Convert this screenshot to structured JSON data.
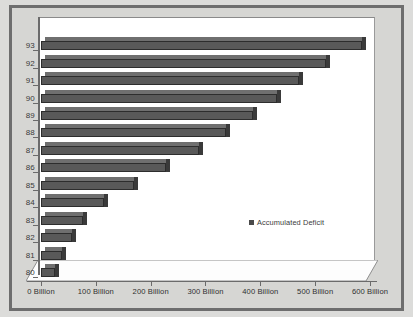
{
  "chart_data": {
    "type": "bar",
    "orientation": "horizontal",
    "title": "",
    "subtitle": "",
    "xlabel": "",
    "ylabel": "",
    "categories": [
      "80",
      "81",
      "82",
      "83",
      "84",
      "85",
      "86",
      "87",
      "88",
      "89",
      "90",
      "91",
      "92",
      "93"
    ],
    "values": [
      26,
      39,
      57,
      77,
      114,
      169,
      228,
      288,
      338,
      387,
      430,
      470,
      520,
      585
    ],
    "series": [
      {
        "name": "Accumulated Deficit",
        "values": [
          26,
          39,
          57,
          77,
          114,
          169,
          228,
          288,
          338,
          387,
          430,
          470,
          520,
          585
        ]
      }
    ],
    "units": "Billion",
    "xlim": [
      0,
      600
    ],
    "xticks": [
      0,
      100,
      200,
      300,
      400,
      500,
      600
    ],
    "xticklabels": [
      "0 Billion",
      "100 Billion",
      "200 Billion",
      "300 Billion",
      "400 Billion",
      "500 Billion",
      "600 Billion"
    ],
    "yticklabels": [
      "93",
      "92",
      "91",
      "90",
      "89",
      "88",
      "87",
      "86",
      "85",
      "84",
      "83",
      "82",
      "81",
      "80"
    ],
    "grid": false,
    "legend": {
      "position": "center-right-inside",
      "entries": [
        "Accumulated Deficit"
      ]
    },
    "style": {
      "bar_face_color": "#595959",
      "bar_top_color": "#6f6f6f",
      "bar_side_color": "#3a3a3a",
      "bar_edge_color": "#2d2d2d",
      "plot_background": "#ffffff",
      "page_background": "#d6d6d3",
      "frame_color": "#6e6e6e",
      "axis_color": "#6b6b6b",
      "text_color": "#3a3a3a"
    }
  },
  "legend": {
    "label": "Accumulated Deficit"
  }
}
